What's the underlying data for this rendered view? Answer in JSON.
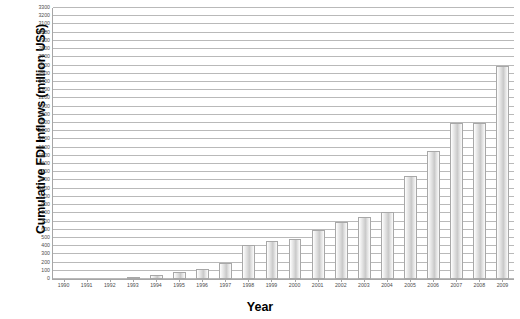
{
  "chart_data": {
    "type": "bar",
    "title": "",
    "xlabel": "Year",
    "ylabel": "Cumulative FDI Inflows (million US$)",
    "ylim": [
      0,
      3300
    ],
    "ytick_step": 100,
    "grid": true,
    "legend": "none",
    "categories": [
      "1990",
      "1991",
      "1992",
      "1993",
      "1994",
      "1995",
      "1996",
      "1997",
      "1998",
      "1999",
      "2000",
      "2001",
      "2002",
      "2003",
      "2004",
      "2005",
      "2006",
      "2007",
      "2008",
      "2009"
    ],
    "values": [
      0,
      0,
      0,
      30,
      45,
      90,
      120,
      190,
      420,
      460,
      490,
      600,
      700,
      760,
      820,
      1250,
      1560,
      1900,
      1900,
      2600
    ],
    "yticks": [
      "0",
      "100",
      "200",
      "300",
      "400",
      "500",
      "600",
      "700",
      "800",
      "900",
      "1000",
      "1100",
      "1200",
      "1300",
      "1400",
      "1500",
      "1600",
      "1700",
      "1800",
      "1900",
      "2000",
      "2100",
      "2200",
      "2300",
      "2400",
      "2500",
      "2600",
      "2700",
      "2800",
      "2900",
      "3000",
      "3100",
      "3200",
      "3300"
    ],
    "colors": {
      "bar_fill": "#d9d9d9",
      "bar_border": "#a8a8a8",
      "gridline": "#b9b9b9",
      "axis": "#a6a6a6",
      "tick_text": "#4c4c4c",
      "axis_title": "#000000"
    }
  }
}
